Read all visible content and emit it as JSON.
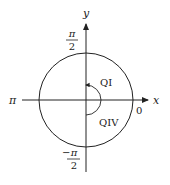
{
  "diagram": {
    "type": "unit-circle-angle",
    "axes": {
      "x_label": "x",
      "y_label": "y"
    },
    "angle_labels": {
      "top_num": "π",
      "top_den": "2",
      "left": "π",
      "right": "0",
      "bottom_sign": "−",
      "bottom_num": "π",
      "bottom_den": "2"
    },
    "quadrant_labels": {
      "q1": "QI",
      "q4": "QIV"
    },
    "colors": {
      "stroke": "#222222",
      "background": "#ffffff"
    }
  }
}
